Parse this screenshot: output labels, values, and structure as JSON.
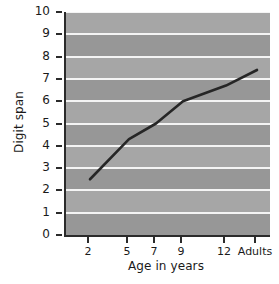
{
  "chart_data": {
    "type": "line",
    "title": "",
    "xlabel": "Age in years",
    "ylabel": "Digit span",
    "categories": [
      "2",
      "5",
      "7",
      "9",
      "12",
      "Adults"
    ],
    "values": [
      2.5,
      4.3,
      5.0,
      6.0,
      6.7,
      7.4
    ],
    "series": [
      {
        "name": "Digit span",
        "values": [
          2.5,
          4.3,
          5.0,
          6.0,
          6.7,
          7.4
        ]
      }
    ],
    "ylim": [
      0,
      10
    ],
    "yticks": [
      "0",
      "1",
      "2",
      "3",
      "4",
      "5",
      "6",
      "7",
      "8",
      "9",
      "10"
    ],
    "xticks": [
      "2",
      "5",
      "7",
      "9",
      "12",
      "Adults"
    ],
    "grid": true,
    "legend": "none",
    "colors": {
      "plot_background": "#9d9d9d",
      "band_light": "#a6a6a6",
      "band_dark": "#979797",
      "gridline": "#f4f4f4",
      "line": "#262626",
      "axis": "#2b2b2b",
      "text": "#1a1a1a",
      "page_background": "#ffffff"
    }
  }
}
